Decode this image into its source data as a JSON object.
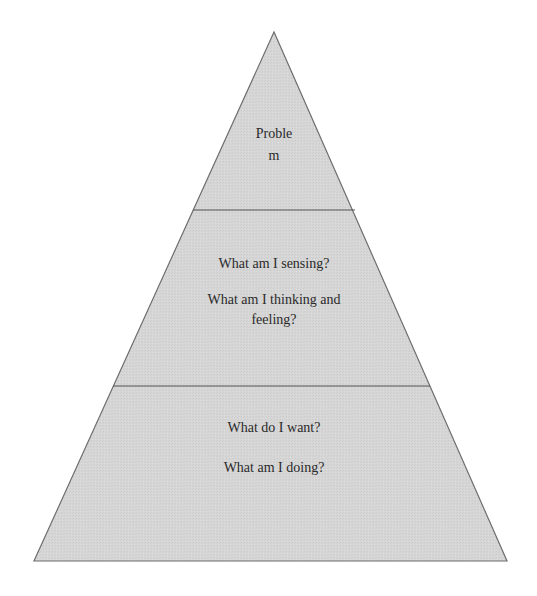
{
  "diagram": {
    "type": "pyramid",
    "colors": {
      "fill": "#d6d6d6",
      "stroke": "#6e6e6e",
      "divider": "#555555",
      "text": "#2a2a2a"
    },
    "geometry": {
      "apex": [
        274,
        32
      ],
      "base_left": [
        34,
        561
      ],
      "base_right": [
        507,
        561
      ],
      "divider_1": {
        "y": 210,
        "x1": 193,
        "x2": 355
      },
      "divider_2": {
        "y": 386,
        "x1": 113,
        "x2": 430
      }
    },
    "tiers": [
      {
        "name": "top",
        "lines": [
          "Proble",
          "m"
        ]
      },
      {
        "name": "middle",
        "items": [
          {
            "lines": [
              "What am I sensing?"
            ]
          },
          {
            "lines": [
              "What am I thinking and",
              "feeling?"
            ]
          }
        ]
      },
      {
        "name": "bottom",
        "items": [
          {
            "lines": [
              "What do I want?"
            ]
          },
          {
            "lines": [
              "What am I doing?"
            ]
          }
        ]
      }
    ]
  }
}
